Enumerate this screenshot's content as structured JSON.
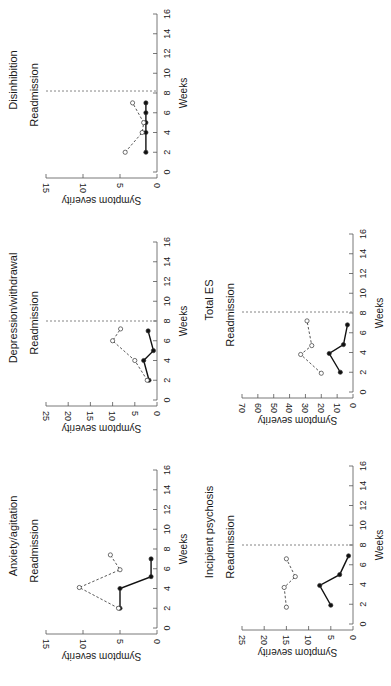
{
  "figure": {
    "orientation": "rotated 90° counterclockwise",
    "layout": "2 columns x 3 rows, top-right empty"
  },
  "chart_data": [
    {
      "type": "line",
      "title": "Disinhibition",
      "annotation": "Readmission",
      "readmission_week": 8.2,
      "xlabel": "Weeks",
      "ylabel": "Symptom severity",
      "xlim": [
        0,
        16
      ],
      "xticks": [
        0,
        2,
        4,
        6,
        8,
        10,
        12,
        14,
        16
      ],
      "ylim": [
        0,
        15
      ],
      "yticks": [
        0,
        5,
        10,
        15
      ],
      "grid": false,
      "series": [
        {
          "name": "filled",
          "style": "solid",
          "marker": "filled-circle",
          "x": [
            2,
            4,
            5,
            6,
            7
          ],
          "values": [
            1.5,
            1.5,
            1.5,
            1.5,
            1.5
          ]
        },
        {
          "name": "open",
          "style": "dashed",
          "marker": "open-circle",
          "x": [
            2,
            4,
            5,
            7
          ],
          "values": [
            4.3,
            2.0,
            1.8,
            3.3
          ]
        }
      ],
      "panel": {
        "col": 0,
        "row": 0
      }
    },
    {
      "type": "line",
      "title": "Depression/withdrawal",
      "annotation": "Readmission",
      "readmission_week": 8,
      "xlabel": "Weeks",
      "ylabel": "Symptom severity",
      "xlim": [
        0,
        16
      ],
      "xticks": [
        0,
        2,
        4,
        6,
        8,
        10,
        12,
        14,
        16
      ],
      "ylim": [
        0,
        25
      ],
      "yticks": [
        0,
        5,
        10,
        15,
        20,
        25
      ],
      "grid": false,
      "series": [
        {
          "name": "filled",
          "style": "solid",
          "marker": "filled-circle",
          "x": [
            2,
            4,
            5,
            7
          ],
          "values": [
            1.8,
            3.0,
            0.8,
            2.0
          ]
        },
        {
          "name": "open",
          "style": "dashed",
          "marker": "open-circle",
          "x": [
            2,
            4,
            6,
            7.2
          ],
          "values": [
            2.2,
            5.0,
            10.0,
            8.2
          ]
        }
      ],
      "panel": {
        "col": 0,
        "row": 1
      }
    },
    {
      "type": "line",
      "title": "Anxiety/agitation",
      "annotation": "Readmission",
      "readmission_week": null,
      "xlabel": "Weeks",
      "ylabel": "Symptom severity",
      "xlim": [
        0,
        16
      ],
      "xticks": [
        0,
        2,
        4,
        6,
        8,
        10,
        12,
        14,
        16
      ],
      "ylim": [
        0,
        15
      ],
      "yticks": [
        0,
        5,
        10,
        15
      ],
      "grid": false,
      "series": [
        {
          "name": "filled",
          "style": "solid",
          "marker": "filled-circle",
          "x": [
            2,
            4,
            5.2,
            7
          ],
          "values": [
            5.0,
            5.0,
            0.8,
            0.8
          ]
        },
        {
          "name": "open",
          "style": "dashed",
          "marker": "open-circle",
          "x": [
            2,
            4.1,
            5.9,
            7.4
          ],
          "values": [
            5.2,
            10.5,
            5.0,
            6.3
          ]
        }
      ],
      "panel": {
        "col": 0,
        "row": 2
      }
    },
    {
      "type": "line",
      "title": "Total ES",
      "annotation": "Readmission",
      "readmission_week": 8.1,
      "xlabel": "Weeks",
      "ylabel": "Symptom severity",
      "xlim": [
        0,
        16
      ],
      "xticks": [
        0,
        2,
        4,
        6,
        8,
        10,
        12,
        14,
        16
      ],
      "ylim": [
        0,
        70
      ],
      "yticks": [
        0,
        10,
        20,
        30,
        40,
        50,
        60,
        70
      ],
      "grid": false,
      "series": [
        {
          "name": "filled",
          "style": "solid",
          "marker": "filled-circle",
          "x": [
            2,
            3.9,
            4.8,
            6.8
          ],
          "values": [
            8,
            15,
            6,
            3.5
          ]
        },
        {
          "name": "open",
          "style": "dashed",
          "marker": "open-circle",
          "x": [
            1.9,
            3.8,
            4.7,
            7.2
          ],
          "values": [
            20,
            33,
            26,
            29
          ]
        }
      ],
      "panel": {
        "col": 1,
        "row": 1
      }
    },
    {
      "type": "line",
      "title": "Incipient psychosis",
      "annotation": "Readmission",
      "readmission_week": 8,
      "xlabel": "Weeks",
      "ylabel": "Symptom severity",
      "xlim": [
        0,
        16
      ],
      "xticks": [
        0,
        2,
        4,
        6,
        8,
        10,
        12,
        14,
        16
      ],
      "ylim": [
        0,
        25
      ],
      "yticks": [
        0,
        5,
        10,
        15,
        20,
        25
      ],
      "grid": false,
      "series": [
        {
          "name": "filled",
          "style": "solid",
          "marker": "filled-circle",
          "x": [
            1.9,
            3.9,
            5,
            6.9
          ],
          "values": [
            5.0,
            7.5,
            3.0,
            1.0
          ]
        },
        {
          "name": "open",
          "style": "dashed",
          "marker": "open-circle",
          "x": [
            1.7,
            3.7,
            4.8,
            6.6
          ],
          "values": [
            15.0,
            15.5,
            13.0,
            15.0
          ]
        }
      ],
      "panel": {
        "col": 1,
        "row": 2
      }
    }
  ]
}
